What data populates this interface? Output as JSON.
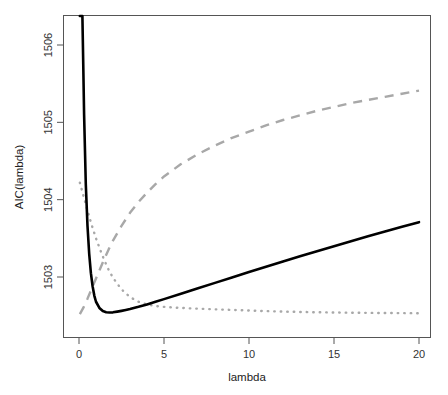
{
  "chart_data": {
    "type": "line",
    "title": "",
    "xlabel": "lambda",
    "ylabel": "AIC(lambda)",
    "xlim": [
      0,
      20
    ],
    "ylim": [
      1502.5,
      1506.35
    ],
    "xticks": [
      0,
      5,
      10,
      15,
      20
    ],
    "xtick_labels": [
      "0",
      "5",
      "10",
      "15",
      "20"
    ],
    "yticks": [
      1503,
      1504,
      1505,
      1506
    ],
    "ytick_labels": [
      "1503",
      "1504",
      "1505",
      "1506"
    ],
    "grid": false,
    "legend": "none",
    "series": [
      {
        "name": "solid-curve",
        "style": "solid",
        "color": "#000000",
        "x": [
          0.05,
          0.1,
          0.15,
          0.2,
          0.25,
          0.3,
          0.4,
          0.5,
          0.6,
          0.7,
          0.8,
          0.9,
          1.0,
          1.2,
          1.4,
          1.6,
          1.8,
          2.0,
          2.25,
          2.5,
          2.75,
          3.0,
          3.5,
          4.0,
          4.5,
          5.0,
          6.0,
          7.0,
          8.0,
          9.0,
          10.0,
          11.0,
          12.0,
          13.0,
          14.0,
          15.0,
          16.0,
          17.0,
          18.0,
          19.0,
          20.0
        ],
        "y": [
          1512.9,
          1509.6,
          1507.8,
          1506.6,
          1505.75,
          1505.1,
          1504.2,
          1503.66,
          1503.3,
          1503.05,
          1502.88,
          1502.76,
          1502.68,
          1502.6,
          1502.56,
          1502.545,
          1502.54,
          1502.543,
          1502.552,
          1502.562,
          1502.573,
          1502.585,
          1502.614,
          1502.646,
          1502.68,
          1502.714,
          1502.784,
          1502.854,
          1502.924,
          1502.994,
          1503.064,
          1503.133,
          1503.201,
          1503.268,
          1503.334,
          1503.399,
          1503.463,
          1503.526,
          1503.588,
          1503.649,
          1503.709
        ]
      },
      {
        "name": "dashed-curve",
        "style": "dashed",
        "color": "#a8a8a8",
        "x": [
          0.05,
          0.25,
          0.5,
          0.75,
          1.0,
          1.25,
          1.5,
          1.75,
          2.0,
          2.5,
          3.0,
          3.5,
          4.0,
          4.5,
          5.0,
          6.0,
          7.0,
          8.0,
          9.0,
          10.0,
          11.0,
          12.0,
          13.0,
          14.0,
          15.0,
          16.0,
          17.0,
          18.0,
          19.0,
          20.0
        ],
        "y": [
          1502.52,
          1502.6,
          1502.72,
          1502.85,
          1502.98,
          1503.11,
          1503.24,
          1503.36,
          1503.47,
          1503.66,
          1503.83,
          1503.97,
          1504.09,
          1504.2,
          1504.3,
          1504.46,
          1504.59,
          1504.7,
          1504.8,
          1504.88,
          1504.96,
          1505.03,
          1505.09,
          1505.15,
          1505.2,
          1505.25,
          1505.29,
          1505.33,
          1505.37,
          1505.41
        ]
      },
      {
        "name": "dotted-curve",
        "style": "dotted",
        "color": "#a8a8a8",
        "x": [
          0.05,
          0.25,
          0.5,
          0.75,
          1.0,
          1.25,
          1.5,
          1.75,
          2.0,
          2.5,
          3.0,
          3.5,
          4.0,
          4.5,
          5.0,
          5.5,
          6.0,
          6.5,
          7.0,
          8.0,
          9.0,
          10.0,
          11.0,
          12.0,
          13.0,
          14.0,
          15.0,
          16.0,
          17.0,
          18.0,
          19.0,
          20.0
        ],
        "y": [
          1504.22,
          1504.06,
          1503.86,
          1503.67,
          1503.5,
          1503.35,
          1503.21,
          1503.09,
          1502.99,
          1502.84,
          1502.74,
          1502.68,
          1502.645,
          1502.625,
          1502.614,
          1502.606,
          1502.6,
          1502.595,
          1502.59,
          1502.582,
          1502.574,
          1502.566,
          1502.559,
          1502.553,
          1502.548,
          1502.544,
          1502.541,
          1502.538,
          1502.536,
          1502.534,
          1502.533,
          1502.532
        ]
      }
    ]
  },
  "axes": {
    "x_title": "lambda",
    "y_title": "AIC(lambda)"
  }
}
